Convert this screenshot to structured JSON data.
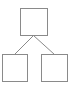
{
  "diagram": {
    "type": "tree",
    "stroke_color": "#8a8a8a",
    "fill_color": "#ffffff",
    "nodes": [
      {
        "id": "root",
        "x": 20.5,
        "y": 8.5,
        "w": 27,
        "h": 27,
        "label": ""
      },
      {
        "id": "left-child",
        "x": 2.5,
        "y": 54.5,
        "w": 25,
        "h": 27,
        "label": ""
      },
      {
        "id": "right-child",
        "x": 41.5,
        "y": 54.5,
        "w": 26,
        "h": 27,
        "label": ""
      }
    ],
    "edges": [
      {
        "from": "root",
        "to": "left-child",
        "x1": 33.5,
        "y1": 35.5,
        "x2": 14.5,
        "y2": 54.5
      },
      {
        "from": "root",
        "to": "right-child",
        "x1": 33.5,
        "y1": 35.5,
        "x2": 54.5,
        "y2": 54.5
      }
    ]
  }
}
